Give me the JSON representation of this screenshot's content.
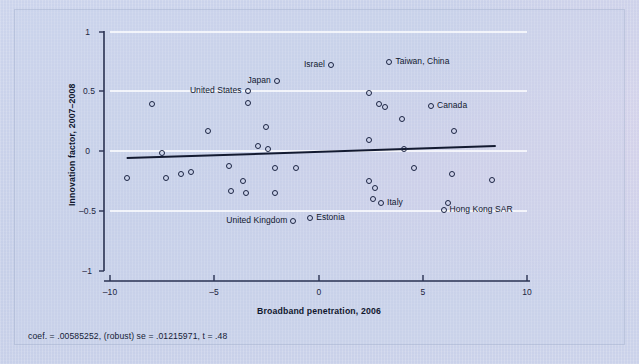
{
  "figure": {
    "xlabel": "Broadband penetration, 2006",
    "ylabel": "Innovation factor, 2007–2008",
    "footnote": "coef. = .00585252, (robust) se = .01215971, t = .48",
    "background_color": "#c9d2ea",
    "marker_color": "#1b2443",
    "gridline_color": "#ffffff",
    "axis_color": "#2a3252",
    "fitline_color": "#131a30"
  },
  "chart_data": {
    "type": "scatter",
    "title": "",
    "xlabel": "Broadband penetration, 2006",
    "ylabel": "Innovation factor, 2007–2008",
    "xlim": [
      -10,
      10
    ],
    "ylim": [
      -1,
      1
    ],
    "xticks": [
      -10,
      -5,
      0,
      5,
      10
    ],
    "xticklabels": [
      "–10",
      "–5",
      "0",
      "5",
      "10"
    ],
    "yticks": [
      -1,
      -0.5,
      0,
      0.5,
      1
    ],
    "yticklabels": [
      "–1",
      "–0.5",
      "0",
      "0.5",
      "1"
    ],
    "grid": "horizontal",
    "legend": "none",
    "fit_line": {
      "slope": 0.00585252,
      "intercept": 0.0,
      "se": 0.01215971,
      "t": 0.48,
      "x_start": -9.2,
      "x_end": 8.5,
      "y_start": -0.055,
      "y_end": 0.045
    },
    "points": [
      {
        "x": -9.2,
        "y": -0.225,
        "label": ""
      },
      {
        "x": -8.0,
        "y": 0.395,
        "label": ""
      },
      {
        "x": -7.5,
        "y": -0.015,
        "label": ""
      },
      {
        "x": -7.3,
        "y": -0.225,
        "label": ""
      },
      {
        "x": -6.6,
        "y": -0.185,
        "label": ""
      },
      {
        "x": -6.1,
        "y": -0.17,
        "label": ""
      },
      {
        "x": -5.3,
        "y": 0.175,
        "label": ""
      },
      {
        "x": -4.3,
        "y": -0.12,
        "label": ""
      },
      {
        "x": -4.2,
        "y": -0.33,
        "label": ""
      },
      {
        "x": -3.4,
        "y": 0.505,
        "label": "United States"
      },
      {
        "x": -3.4,
        "y": 0.405,
        "label": ""
      },
      {
        "x": -3.6,
        "y": -0.245,
        "label": ""
      },
      {
        "x": -3.5,
        "y": -0.35,
        "label": ""
      },
      {
        "x": -2.5,
        "y": 0.205,
        "label": ""
      },
      {
        "x": -2.0,
        "y": 0.59,
        "label": "Japan"
      },
      {
        "x": -2.9,
        "y": 0.045,
        "label": ""
      },
      {
        "x": -2.4,
        "y": 0.02,
        "label": ""
      },
      {
        "x": -2.1,
        "y": -0.14,
        "label": ""
      },
      {
        "x": -2.1,
        "y": -0.35,
        "label": ""
      },
      {
        "x": -1.1,
        "y": -0.135,
        "label": ""
      },
      {
        "x": -1.2,
        "y": -0.585,
        "label": "United Kingdom"
      },
      {
        "x": -0.4,
        "y": -0.555,
        "label": "Estonia"
      },
      {
        "x": 0.6,
        "y": 0.725,
        "label": "Israel"
      },
      {
        "x": 2.4,
        "y": 0.1,
        "label": ""
      },
      {
        "x": 2.4,
        "y": -0.25,
        "label": ""
      },
      {
        "x": 2.7,
        "y": -0.305,
        "label": ""
      },
      {
        "x": 2.4,
        "y": 0.49,
        "label": ""
      },
      {
        "x": 2.9,
        "y": 0.4,
        "label": ""
      },
      {
        "x": 3.2,
        "y": 0.37,
        "label": ""
      },
      {
        "x": 3.4,
        "y": 0.75,
        "label": "Taiwan, China"
      },
      {
        "x": 4.0,
        "y": 0.27,
        "label": ""
      },
      {
        "x": 2.6,
        "y": -0.395,
        "label": ""
      },
      {
        "x": 3.0,
        "y": -0.43,
        "label": "Italy"
      },
      {
        "x": 4.1,
        "y": 0.02,
        "label": ""
      },
      {
        "x": 4.6,
        "y": -0.135,
        "label": ""
      },
      {
        "x": 5.4,
        "y": 0.38,
        "label": "Canada"
      },
      {
        "x": 6.5,
        "y": 0.17,
        "label": ""
      },
      {
        "x": 6.4,
        "y": -0.185,
        "label": ""
      },
      {
        "x": 6.2,
        "y": -0.43,
        "label": ""
      },
      {
        "x": 6.0,
        "y": -0.49,
        "label": "Hong Kong SAR"
      },
      {
        "x": 8.3,
        "y": -0.24,
        "label": ""
      }
    ]
  },
  "labels": {
    "united_states": "United States",
    "japan": "Japan",
    "israel": "Israel",
    "taiwan_china": "Taiwan, China",
    "canada": "Canada",
    "italy": "Italy",
    "hong_kong_sar": "Hong Kong SAR",
    "united_kingdom": "United Kingdom",
    "estonia": "Estonia"
  },
  "ticks": {
    "x": [
      "–10",
      "–5",
      "0",
      "5",
      "10"
    ],
    "y": [
      "1",
      "0.5",
      "0",
      "–0.5",
      "–1"
    ]
  }
}
